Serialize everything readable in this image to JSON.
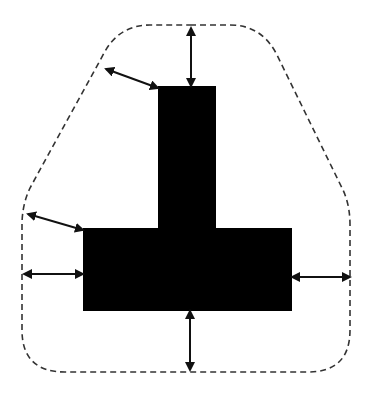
{
  "diagram": {
    "colors": {
      "background": "#ffffff",
      "shape_fill": "#000000",
      "outline": "#333333",
      "arrows": "#111111"
    },
    "shape": {
      "name": "T-shape",
      "stem": {
        "x": 158,
        "y": 86,
        "w": 58,
        "h": 142
      },
      "bar": {
        "x": 83,
        "y": 228,
        "w": 209,
        "h": 83
      }
    },
    "boundary": {
      "style": "dashed",
      "path": "M 190 25 L 230 25 Q 262 25 277 55 L 343 190 Q 350 205 350 225 L 350 330 Q 350 372 308 372 L 65 372 Q 22 372 22 330 L 22 225 Q 22 205 30 188 L 103 55 Q 118 25 150 25 Z"
    },
    "arrows": [
      {
        "name": "top-clearance-arrow",
        "x1": 191,
        "y1": 28,
        "x2": 191,
        "y2": 86
      },
      {
        "name": "top-left-diagonal-clearance-arrow",
        "x1": 106,
        "y1": 69,
        "x2": 158,
        "y2": 88
      },
      {
        "name": "left-diagonal-clearance-arrow",
        "x1": 28,
        "y1": 214,
        "x2": 83,
        "y2": 230
      },
      {
        "name": "left-clearance-arrow",
        "x1": 24,
        "y1": 274,
        "x2": 83,
        "y2": 274
      },
      {
        "name": "right-clearance-arrow",
        "x1": 292,
        "y1": 277,
        "x2": 350,
        "y2": 277
      },
      {
        "name": "bottom-clearance-arrow",
        "x1": 190,
        "y1": 311,
        "x2": 190,
        "y2": 370
      }
    ]
  }
}
